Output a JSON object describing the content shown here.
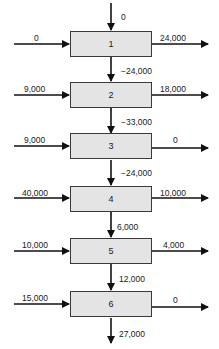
{
  "diagram": {
    "top_input": "0",
    "stages": [
      {
        "id": "1",
        "left_in": "0",
        "right_out": "24,000",
        "down_flow": "−24,000"
      },
      {
        "id": "2",
        "left_in": "9,000",
        "right_out": "18,000",
        "down_flow": "−33,000"
      },
      {
        "id": "3",
        "left_in": "9,000",
        "right_out": "0",
        "down_flow": "−24,000"
      },
      {
        "id": "4",
        "left_in": "40,000",
        "right_out": "10,000",
        "down_flow": "6,000"
      },
      {
        "id": "5",
        "left_in": "10,000",
        "right_out": "4,000",
        "down_flow": "12,000"
      },
      {
        "id": "6",
        "left_in": "15,000",
        "right_out": "0",
        "down_flow": "27,000"
      }
    ],
    "colors": {
      "box_fill": "#e4e4e4",
      "line": "#111111"
    }
  }
}
